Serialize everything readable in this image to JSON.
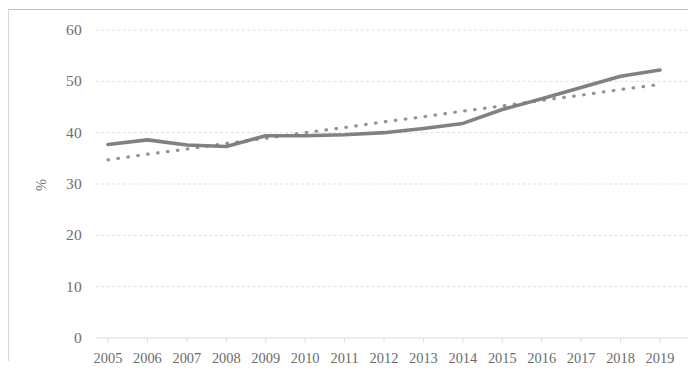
{
  "chart_data": {
    "type": "line",
    "title": "",
    "subtitle": "",
    "xlabel": "",
    "ylabel": "%",
    "categories": [
      "2005",
      "2006",
      "2007",
      "2008",
      "2009",
      "2010",
      "2011",
      "2012",
      "2013",
      "2014",
      "2015",
      "2016",
      "2017",
      "2018",
      "2019"
    ],
    "x": [
      2005,
      2006,
      2007,
      2008,
      2009,
      2010,
      2011,
      2012,
      2013,
      2014,
      2015,
      2016,
      2017,
      2018,
      2019
    ],
    "ylim": [
      0,
      60
    ],
    "xlim": [
      2005,
      2019
    ],
    "yticks": [
      0,
      10,
      20,
      30,
      40,
      50,
      60
    ],
    "ytick_labels": [
      "0",
      "10",
      "20",
      "30",
      "40",
      "50",
      "60"
    ],
    "xtick_labels": [
      "2005",
      "2006",
      "2007",
      "2008",
      "2009",
      "2010",
      "2011",
      "2012",
      "2013",
      "2014",
      "2015",
      "2016",
      "2017",
      "2018",
      "2019"
    ],
    "grid": true,
    "grid_axis": "y",
    "legend": false,
    "legend_position": "none",
    "series": [
      {
        "name": "Value",
        "style": "solid",
        "color": "#7a7a7a",
        "width": 3.6,
        "values": [
          37.7,
          38.6,
          37.6,
          37.3,
          39.4,
          39.4,
          39.6,
          40.0,
          40.8,
          41.8,
          44.5,
          46.6,
          48.8,
          51.0,
          52.2
        ]
      },
      {
        "name": "Trend",
        "style": "dotted",
        "color": "#8a8a8a",
        "width": 3.2,
        "values": [
          34.7,
          35.8,
          36.8,
          37.9,
          38.9,
          40.0,
          41.0,
          42.1,
          43.1,
          44.2,
          45.2,
          46.3,
          47.3,
          48.4,
          49.4
        ]
      }
    ]
  },
  "axis": {
    "y_title": "%",
    "y_ticks": [
      "60",
      "50",
      "40",
      "30",
      "20",
      "10",
      "0"
    ],
    "x_ticks": [
      "2005",
      "2006",
      "2007",
      "2008",
      "2009",
      "2010",
      "2011",
      "2012",
      "2013",
      "2014",
      "2015",
      "2016",
      "2017",
      "2018",
      "2019"
    ]
  },
  "colors": {
    "series_solid": "#7a7a7a",
    "series_dotted": "#8a8a8a",
    "gridline": "#d7d7d7",
    "axis_text": "#6e6e6e",
    "background": "#ffffff",
    "border": "#bdbdbd"
  }
}
